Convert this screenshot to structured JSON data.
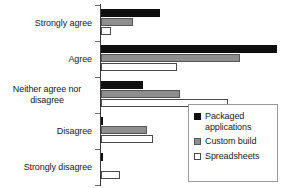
{
  "chart_data": {
    "type": "bar",
    "orientation": "horizontal",
    "title": "",
    "xlabel": "",
    "ylabel": "",
    "grid": false,
    "legend_position": "bottom-right",
    "categories": [
      "Strongly agree",
      "Agree",
      "Neither agree nor disagree",
      "Disagree",
      "Strongly disagree"
    ],
    "xlim": [
      0,
      110
    ],
    "series": [
      {
        "name": "Packaged applications",
        "color": "#100f0f",
        "values": [
          35,
          104,
          25,
          1,
          1
        ]
      },
      {
        "name": "Custom build",
        "color": "#8e8e8e",
        "values": [
          19,
          82,
          47,
          27,
          0
        ]
      },
      {
        "name": "Spreadsheets",
        "color": "#ffffff",
        "values": [
          6,
          45,
          75,
          31,
          11
        ]
      }
    ]
  },
  "axis": {
    "category_labels": [
      {
        "line1": "Strongly agree",
        "line2": ""
      },
      {
        "line1": "Agree",
        "line2": ""
      },
      {
        "line1": "Neither agree nor",
        "line2": "disagree"
      },
      {
        "line1": "Disagree",
        "line2": ""
      },
      {
        "line1": "Strongly disagree",
        "line2": ""
      }
    ]
  },
  "legend": {
    "entries": [
      {
        "label_line1": "Packaged",
        "label_line2": "applications",
        "swatch": "black-square-icon"
      },
      {
        "label_line1": "Custom build",
        "label_line2": "",
        "swatch": "gray-square-icon"
      },
      {
        "label_line1": "Spreadsheets",
        "label_line2": "",
        "swatch": "white-square-icon"
      }
    ]
  }
}
